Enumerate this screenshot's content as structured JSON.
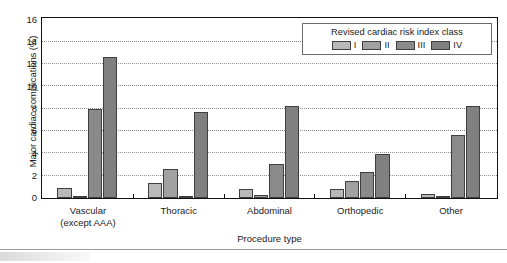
{
  "chart_data": {
    "type": "bar",
    "title": "",
    "subtitle": "",
    "xlabel": "Procedure type",
    "ylabel": "Major cardiac complications (%)",
    "categories": [
      "Vascular (except AAA)",
      "Thoracic",
      "Abdominal",
      "Orthopedic",
      "Other"
    ],
    "category_lines": [
      [
        "Vascular",
        "(except AAA)"
      ],
      [
        "Thoracic"
      ],
      [
        "Abdominal"
      ],
      [
        "Orthopedic"
      ],
      [
        "Other"
      ]
    ],
    "series": [
      {
        "name": "I",
        "values": [
          0.9,
          1.3,
          0.8,
          0.8,
          0.4
        ]
      },
      {
        "name": "II",
        "values": [
          0.2,
          2.6,
          0.3,
          1.5,
          0.1
        ]
      },
      {
        "name": "III",
        "values": [
          8.0,
          0.1,
          3.0,
          2.3,
          5.6
        ]
      },
      {
        "name": "IV",
        "values": [
          12.6,
          7.7,
          8.2,
          3.9,
          8.2
        ]
      }
    ],
    "ylim": [
      0,
      16
    ],
    "yticks": [
      0,
      2,
      4,
      6,
      8,
      10,
      12,
      14,
      16
    ],
    "ytick_labels": [
      "0",
      "2",
      "4",
      "6",
      "8",
      "10",
      "12",
      "14",
      "16"
    ],
    "grid": true,
    "grid_axis": "y",
    "legend": {
      "title": "Revised cardiac risk index  class",
      "position": "top-right",
      "entries": [
        "I",
        "II",
        "III",
        "IV"
      ]
    },
    "series_colors": [
      "#b9b9b9",
      "#a1a1a1",
      "#8a8a8a",
      "#808080"
    ],
    "axis_color": "#111111",
    "grid_color": "#8c8c8c"
  }
}
